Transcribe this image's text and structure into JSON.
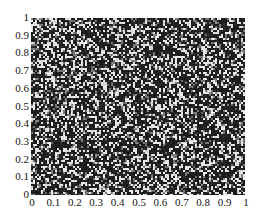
{
  "chart_data": {
    "type": "heatmap",
    "title": "",
    "xlabel": "",
    "ylabel": "",
    "xlim": [
      0,
      1
    ],
    "ylim": [
      0,
      1
    ],
    "grid": false,
    "legend": null,
    "colormap": "binary random field (mostly dark with scattered white pixels)",
    "colors": {
      "dark": "#1a1a1a",
      "light": "#f0f0f0"
    },
    "x_ticks": [
      "0",
      "0.1",
      "0.2",
      "0.3",
      "0.4",
      "0.5",
      "0.6",
      "0.7",
      "0.8",
      "0.9",
      "1"
    ],
    "y_ticks": [
      "0",
      "0.1",
      "0.2",
      "0.3",
      "0.4",
      "0.5",
      "0.6",
      "0.7",
      "0.8",
      "0.9",
      "1"
    ]
  }
}
